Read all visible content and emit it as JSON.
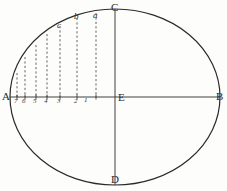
{
  "figure": {
    "kind": "geometric-diagram",
    "background_color": "#fdfdfc",
    "ink_color": "#2b2a28",
    "dash_color": "#55524c",
    "canvas": {
      "width": 227,
      "height": 191
    }
  },
  "ellipse": {
    "center": {
      "x": 115,
      "y": 97
    },
    "radius_x": 105,
    "radius_y": 88,
    "stroke_width": 1.2
  },
  "axes": {
    "major": {
      "label_left": "A",
      "label_right": "B",
      "y": 97,
      "x1": 10,
      "x2": 220
    },
    "minor": {
      "label_top": "C",
      "label_bottom": "D",
      "x": 115,
      "y1": 9,
      "y2": 185
    },
    "center_label": "E"
  },
  "vertex_labels": [
    {
      "id": "A",
      "text": "A",
      "x": 2,
      "y": 91,
      "style": "cap"
    },
    {
      "id": "B",
      "text": "B",
      "x": 216,
      "y": 91,
      "style": "cap"
    },
    {
      "id": "C",
      "text": "C",
      "x": 111,
      "y": 2,
      "style": "cap"
    },
    {
      "id": "D",
      "text": "D",
      "x": 111,
      "y": 174,
      "style": "cap"
    },
    {
      "id": "E",
      "text": "E",
      "x": 118,
      "y": 92,
      "style": "cap"
    }
  ],
  "curve_point_labels": [
    {
      "id": "a",
      "text": "a",
      "x": 93,
      "y": 11,
      "style": "italic"
    },
    {
      "id": "b",
      "text": "b",
      "x": 74,
      "y": 12,
      "style": "italic"
    },
    {
      "id": "c",
      "text": "c",
      "x": 57,
      "y": 21,
      "style": "italic"
    }
  ],
  "ordinates": [
    {
      "index": 7,
      "tick_label": "7",
      "x": 17,
      "curve_y": 73,
      "axis_y": 97,
      "label_x": 14,
      "label_y": 98
    },
    {
      "index": 6,
      "tick_label": "6",
      "x": 25,
      "curve_y": 57,
      "axis_y": 97,
      "label_x": 22,
      "label_y": 98
    },
    {
      "index": 5,
      "tick_label": "5",
      "x": 36,
      "curve_y": 45,
      "axis_y": 97,
      "label_x": 33,
      "label_y": 98
    },
    {
      "index": 4,
      "tick_label": "4",
      "x": 47,
      "curve_y": 34,
      "axis_y": 97,
      "label_x": 44,
      "label_y": 98
    },
    {
      "index": 3,
      "tick_label": "3",
      "x": 60,
      "curve_y": 26,
      "axis_y": 97,
      "label_x": 57,
      "label_y": 98
    },
    {
      "index": 2,
      "tick_label": "2",
      "x": 77,
      "curve_y": 18,
      "axis_y": 97,
      "label_x": 74,
      "label_y": 98
    },
    {
      "index": 1,
      "tick_label": "1",
      "x": 96,
      "curve_y": 13,
      "axis_y": 97,
      "label_x": 84,
      "label_y": 97
    }
  ]
}
